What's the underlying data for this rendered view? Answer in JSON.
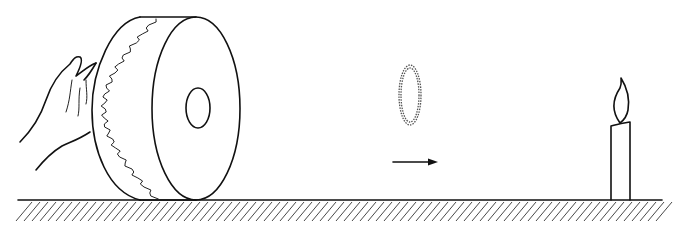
{
  "figure": {
    "objects": [
      {
        "name": "hand",
        "icon": "hand-icon"
      },
      {
        "name": "drum",
        "icon": "drum-icon"
      },
      {
        "name": "vortex-ring",
        "icon": "smoke-ring-icon"
      },
      {
        "name": "direction-arrow",
        "icon": "arrow-right-icon"
      },
      {
        "name": "candle",
        "icon": "candle-icon"
      },
      {
        "name": "ground",
        "icon": "hatched-ground-icon"
      }
    ],
    "colors": {
      "ink": "#111111",
      "background": "#ffffff"
    }
  }
}
